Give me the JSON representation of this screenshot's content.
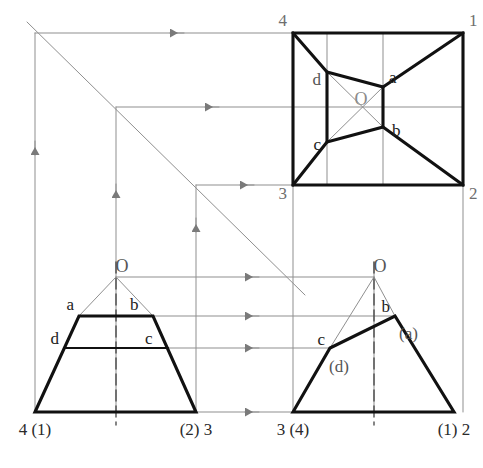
{
  "figure": {
    "colors": {
      "outline": "#111111",
      "construction": "#8f8f8f",
      "label_dark": "#1a1a1a",
      "label_gray": "#6e6e6e",
      "background": "#ffffff"
    },
    "stroke_widths": {
      "outline": 3.1,
      "construction": 1.0,
      "thin_solid": 2.0
    }
  },
  "views": {
    "top": {
      "name": "top-view",
      "outer_square": {
        "corners": [
          {
            "label": "4",
            "x": 293,
            "y": 33
          },
          {
            "label": "1",
            "x": 463,
            "y": 33
          },
          {
            "label": "2",
            "x": 463,
            "y": 185
          },
          {
            "label": "3",
            "x": 293,
            "y": 185
          }
        ],
        "corner_labels": [
          {
            "text": "4",
            "x": 287,
            "y": 26,
            "anchor": "end",
            "color": "#6e6e6e",
            "size": 17
          },
          {
            "text": "1",
            "x": 469,
            "y": 26,
            "anchor": "start",
            "color": "#6e6e6e",
            "size": 17
          },
          {
            "text": "2",
            "x": 469,
            "y": 199,
            "anchor": "start",
            "color": "#6e6e6e",
            "size": 17
          },
          {
            "text": "3",
            "x": 287,
            "y": 199,
            "anchor": "end",
            "color": "#6e6e6e",
            "size": 17
          }
        ]
      },
      "inner_rect": {
        "corners": [
          {
            "label": "d",
            "x": 327,
            "y": 72
          },
          {
            "label": "a",
            "x": 383,
            "y": 87
          },
          {
            "label": "b",
            "x": 383,
            "y": 127
          },
          {
            "label": "c",
            "x": 327,
            "y": 142
          }
        ],
        "corner_labels": [
          {
            "text": "d",
            "x": 321,
            "y": 85,
            "anchor": "end",
            "color": "#555555",
            "size": 17
          },
          {
            "text": "a",
            "x": 389,
            "y": 83,
            "anchor": "start",
            "color": "#222222",
            "size": 17
          },
          {
            "text": "b",
            "x": 392,
            "y": 136,
            "anchor": "start",
            "color": "#222222",
            "size": 17
          },
          {
            "text": "c",
            "x": 321,
            "y": 150,
            "anchor": "end",
            "color": "#222222",
            "size": 17
          }
        ]
      },
      "center_label": {
        "text": "O",
        "x": 361,
        "y": 105,
        "color": "#8a8a8a",
        "size": 18
      },
      "diagonals": [
        {
          "from": [
            327,
            72
          ],
          "to": [
            383,
            127
          ]
        },
        {
          "from": [
            383,
            87
          ],
          "to": [
            327,
            142
          ]
        }
      ],
      "edges_to_corners": [
        {
          "from": [
            293,
            33
          ],
          "to": [
            327,
            72
          ]
        },
        {
          "from": [
            463,
            33
          ],
          "to": [
            383,
            87
          ]
        },
        {
          "from": [
            463,
            185
          ],
          "to": [
            383,
            127
          ]
        },
        {
          "from": [
            293,
            185
          ],
          "to": [
            327,
            142
          ]
        }
      ]
    },
    "front": {
      "name": "front-view",
      "baseline_y": 412,
      "trapezoid": [
        {
          "x": 35,
          "y": 412
        },
        {
          "x": 79,
          "y": 316
        },
        {
          "x": 153,
          "y": 316
        },
        {
          "x": 196,
          "y": 412
        }
      ],
      "dc_line": {
        "from": [
          64,
          348
        ],
        "to": [
          168,
          348
        ]
      },
      "apex": {
        "label": "O",
        "x": 116,
        "y": 277
      },
      "apex_label": {
        "text": "O",
        "x": 122,
        "y": 272,
        "color": "#555555",
        "size": 18
      },
      "apex_rays": [
        {
          "from": [
            116,
            277
          ],
          "to": [
            79,
            316
          ]
        },
        {
          "from": [
            116,
            277
          ],
          "to": [
            153,
            316
          ]
        }
      ],
      "centerline": {
        "x": 116,
        "y1": 262,
        "y2": 425
      },
      "point_labels": [
        {
          "text": "a",
          "x": 74,
          "y": 310,
          "anchor": "end",
          "color": "#222222",
          "size": 17
        },
        {
          "text": "b",
          "x": 130,
          "y": 310,
          "anchor": "start",
          "color": "#222222",
          "size": 17
        },
        {
          "text": "d",
          "x": 59,
          "y": 344,
          "anchor": "end",
          "color": "#222222",
          "size": 17
        },
        {
          "text": "c",
          "x": 145,
          "y": 344,
          "anchor": "start",
          "color": "#222222",
          "size": 17
        }
      ],
      "base_labels": [
        {
          "text": "4 (1)",
          "x": 35,
          "y": 435,
          "anchor": "middle",
          "color": "#2a2a2a",
          "size": 17
        },
        {
          "text": "(2) 3",
          "x": 196,
          "y": 435,
          "anchor": "middle",
          "color": "#2a2a2a",
          "size": 17
        }
      ]
    },
    "side": {
      "name": "side-view",
      "baseline_y": 412,
      "polygon": [
        {
          "x": 293,
          "y": 412
        },
        {
          "x": 330,
          "y": 348
        },
        {
          "x": 395,
          "y": 316
        },
        {
          "x": 454,
          "y": 412
        }
      ],
      "apex": {
        "label": "O",
        "x": 374,
        "y": 277
      },
      "apex_label": {
        "text": "O",
        "x": 380,
        "y": 272,
        "color": "#555555",
        "size": 18
      },
      "apex_rays": [
        {
          "from": [
            374,
            277
          ],
          "to": [
            330,
            348
          ]
        },
        {
          "from": [
            374,
            277
          ],
          "to": [
            395,
            316
          ]
        }
      ],
      "centerline": {
        "x": 374,
        "y1": 262,
        "y2": 425
      },
      "point_labels": [
        {
          "text": "b",
          "x": 390,
          "y": 312,
          "anchor": "end",
          "color": "#222222",
          "size": 17
        },
        {
          "text": "(a)",
          "x": 399,
          "y": 339,
          "anchor": "start",
          "color": "#555555",
          "size": 17
        },
        {
          "text": "c",
          "x": 325,
          "y": 345,
          "anchor": "end",
          "color": "#222222",
          "size": 17
        },
        {
          "text": "(d)",
          "x": 329,
          "y": 372,
          "anchor": "start",
          "color": "#555555",
          "size": 17
        }
      ],
      "base_labels": [
        {
          "text": "3 (4)",
          "x": 293,
          "y": 435,
          "anchor": "middle",
          "color": "#2a2a2a",
          "size": 17
        },
        {
          "text": "(1) 2",
          "x": 454,
          "y": 435,
          "anchor": "middle",
          "color": "#2a2a2a",
          "size": 17
        }
      ]
    }
  },
  "construction": {
    "miter_line": {
      "from": [
        27,
        22
      ],
      "to": [
        305,
        295
      ],
      "angle_deg": 45
    },
    "horizontal_rays_top": [
      {
        "y": 33,
        "x_from": 293,
        "x_to": 35,
        "arrow_x": 170
      },
      {
        "y": 107,
        "x_from": 463,
        "x_to": 116,
        "arrow_x": 205
      },
      {
        "y": 185,
        "x_from": 293,
        "x_to": 196,
        "arrow_x": 240
      }
    ],
    "vertical_drops": [
      {
        "x": 35,
        "y_from": 33,
        "y_to": 412,
        "arrow_y": 155
      },
      {
        "x": 116,
        "y_from": 107,
        "y_to": 412,
        "arrow_y": 198
      },
      {
        "x": 196,
        "y_from": 185,
        "y_to": 412,
        "arrow_y": 232
      }
    ],
    "horizontal_rays_bottom": [
      {
        "y": 277,
        "x_from": 374,
        "x_to": 116,
        "arrow_x": 245
      },
      {
        "y": 316,
        "x_from": 395,
        "x_to": 79,
        "arrow_x": 245
      },
      {
        "y": 348,
        "x_from": 330,
        "x_to": 64,
        "arrow_x": 245
      },
      {
        "y": 412,
        "x_from": 293,
        "x_to": 196,
        "arrow_x": 245
      }
    ],
    "vertical_ties_top": [
      {
        "x": 327,
        "y_from": 33,
        "y_to": 185
      },
      {
        "x": 383,
        "y_from": 33,
        "y_to": 185
      }
    ],
    "vertical_ties_side": [
      {
        "x": 293,
        "y_from": 185,
        "y_to": 412
      },
      {
        "x": 463,
        "y_from": 185,
        "y_to": 412
      },
      {
        "x": 374,
        "y_from": 262,
        "y_to": 412
      }
    ]
  }
}
